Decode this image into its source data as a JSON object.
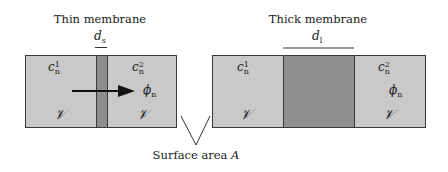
{
  "figure": {
    "panels": [
      {
        "title": "Thin membrane",
        "thickness_label": "d",
        "thickness_sub": "s",
        "left_concentration": {
          "symbol": "c",
          "sub": "n",
          "sup": "1"
        },
        "right_concentration": {
          "symbol": "c",
          "sub": "n",
          "sup": "2"
        },
        "flux": {
          "symbol": "ϕ",
          "sub": "n"
        },
        "left_volume": "𝒱",
        "right_volume": "𝒱"
      },
      {
        "title": "Thick membrane",
        "thickness_label": "d",
        "thickness_sub": "l",
        "left_concentration": {
          "symbol": "c",
          "sub": "n",
          "sup": "1"
        },
        "right_concentration": {
          "symbol": "c",
          "sub": "n",
          "sup": "2"
        },
        "flux": {
          "symbol": "ϕ",
          "sub": "n"
        },
        "left_volume": "𝒱",
        "right_volume": "𝒱"
      }
    ],
    "caption": {
      "text": "Surface area ",
      "symbol": "A"
    },
    "colors": {
      "compartment": "#c9c9c9",
      "membrane": "#8d8d8d",
      "outline": "#3a3a3a",
      "arrow": "#111111"
    }
  }
}
